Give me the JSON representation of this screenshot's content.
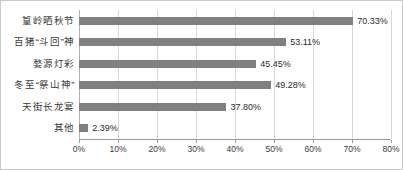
{
  "chart_data": {
    "type": "bar",
    "orientation": "horizontal",
    "title": "",
    "subtitle": "",
    "xlabel": "",
    "ylabel": "",
    "xlim": [
      0,
      80
    ],
    "grid": true,
    "legend": null,
    "bar_color": "#808080",
    "gridline_color": "#d8d8d8",
    "border_color": "#c9c9c9",
    "categories": [
      "篁岭晒秋节",
      "百猪“斗回”神",
      "婺源灯彩",
      "冬至“祭山神”",
      "天街长龙宴",
      "其他"
    ],
    "values": [
      70.33,
      53.11,
      45.45,
      49.28,
      37.8,
      2.39
    ],
    "value_labels": [
      "70.33%",
      "53.11%",
      "45.45%",
      "49.28%",
      "37.80%",
      "2.39%"
    ],
    "xticks": [
      0,
      10,
      20,
      30,
      40,
      50,
      60,
      70,
      80
    ],
    "xtick_labels": [
      "0%",
      "10%",
      "20%",
      "30%",
      "40%",
      "50%",
      "60%",
      "70%",
      "80%"
    ]
  }
}
